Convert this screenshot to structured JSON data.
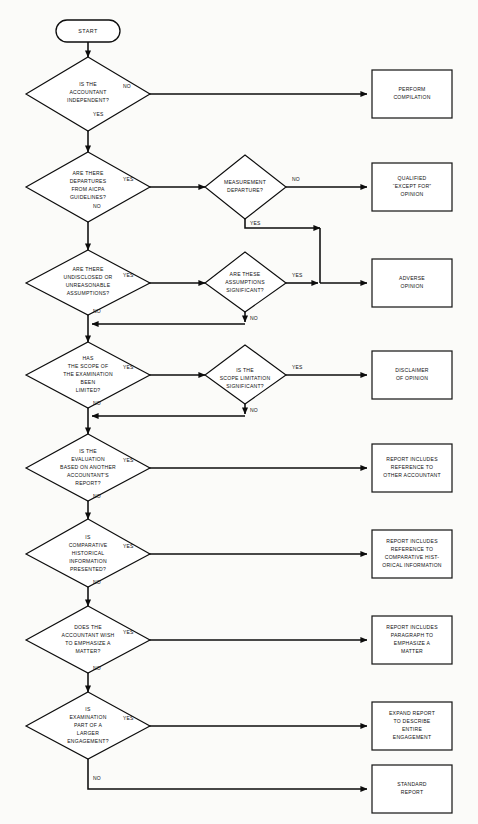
{
  "diagram": {
    "type": "flowchart",
    "start": {
      "label": "START"
    },
    "yes_label": "YES",
    "no_label": "NO",
    "decisions": [
      {
        "id": "independent",
        "lines": [
          "IS THE",
          "ACCOUNTANT",
          "INDEPENDENT?"
        ],
        "yes_target": "departures",
        "no_target": "perform-compilation"
      },
      {
        "id": "departures",
        "lines": [
          "ARE THERE",
          "DEPARTURES",
          "FROM AICPA",
          "GUIDELINES?"
        ],
        "yes_target": "measurement",
        "no_target": "assumptions"
      },
      {
        "id": "measurement",
        "lines": [
          "MEASUREMENT",
          "DEPARTURE?"
        ],
        "yes_target": "adverse-opinion",
        "no_target": "qualified-opinion"
      },
      {
        "id": "assumptions",
        "lines": [
          "ARE THERE",
          "UNDISCLOSED OR",
          "UNREASONABLE",
          "ASSUMPTIONS?"
        ],
        "yes_target": "assumptions-significant",
        "no_target": "scope"
      },
      {
        "id": "assumptions-significant",
        "lines": [
          "ARE THESE",
          "ASSUMPTIONS",
          "SIGNIFICANT?"
        ],
        "yes_target": "adverse-opinion",
        "no_target": "scope"
      },
      {
        "id": "scope",
        "lines": [
          "HAS",
          "THE SCOPE OF",
          "THE EXAMINATION",
          "BEEN",
          "LIMITED?"
        ],
        "yes_target": "scope-significant",
        "no_target": "evaluation"
      },
      {
        "id": "scope-significant",
        "lines": [
          "IS THE",
          "SCOPE LIMITATION",
          "SIGNIFICANT?"
        ],
        "yes_target": "disclaimer-of-opinion",
        "no_target": "evaluation"
      },
      {
        "id": "evaluation",
        "lines": [
          "IS THE",
          "EVALUATION",
          "BASED ON ANOTHER",
          "ACCOUNTANT'S",
          "REPORT?"
        ],
        "yes_target": "reference-other-accountant",
        "no_target": "comparative"
      },
      {
        "id": "comparative",
        "lines": [
          "IS",
          "COMPARATIVE",
          "HISTORICAL",
          "INFORMATION",
          "PRESENTED?"
        ],
        "yes_target": "reference-comparative",
        "no_target": "emphasize"
      },
      {
        "id": "emphasize",
        "lines": [
          "DOES THE",
          "ACCOUNTANT WISH",
          "TO EMPHASIZE A",
          "MATTER?"
        ],
        "yes_target": "paragraph-emphasize",
        "no_target": "larger-engagement"
      },
      {
        "id": "larger-engagement",
        "lines": [
          "IS",
          "EXAMINATION",
          "PART OF A",
          "LARGER",
          "ENGAGEMENT?"
        ],
        "yes_target": "expand-report",
        "no_target": "standard-report"
      }
    ],
    "outcomes": [
      {
        "id": "perform-compilation",
        "lines": [
          "PERFORM",
          "COMPILATION"
        ]
      },
      {
        "id": "qualified-opinion",
        "lines": [
          "QUALIFIED",
          "“EXCEPT FOR”",
          "OPINION"
        ]
      },
      {
        "id": "adverse-opinion",
        "lines": [
          "ADVERSE",
          "OPINION"
        ]
      },
      {
        "id": "disclaimer-of-opinion",
        "lines": [
          "DISCLAIMER",
          "OF OPINION"
        ]
      },
      {
        "id": "reference-other-accountant",
        "lines": [
          "REPORT INCLUDES",
          "REFERENCE TO",
          "OTHER ACCOUNTANT"
        ]
      },
      {
        "id": "reference-comparative",
        "lines": [
          "REPORT INCLUDES",
          "REFERENCE TO",
          "COMPARATIVE HIST-",
          "ORICAL INFORMATION"
        ]
      },
      {
        "id": "paragraph-emphasize",
        "lines": [
          "REPORT INCLUDES",
          "PARAGRAPH TO",
          "EMPHASIZE A",
          "MATTER"
        ]
      },
      {
        "id": "expand-report",
        "lines": [
          "EXPAND REPORT",
          "TO DESCRIBE",
          "ENTIRE",
          "ENGAGEMENT"
        ]
      },
      {
        "id": "standard-report",
        "lines": [
          "STANDARD",
          "REPORT"
        ]
      }
    ],
    "colors": {
      "background": "#fbfbf9",
      "stroke": "#0d0d0d",
      "text": "#111111",
      "shape_fill": "#ffffff"
    }
  }
}
